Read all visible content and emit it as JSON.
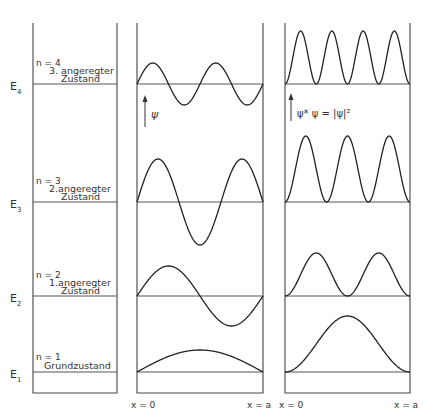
{
  "figure": {
    "panels": {
      "levels": {
        "name": "energy-levels"
      },
      "psi": {
        "name": "wave-function",
        "axis_label": "ψ"
      },
      "density": {
        "name": "probability-density",
        "axis_label": "ψ* ψ = |ψ|²"
      }
    },
    "x_labels": {
      "start": "x = 0",
      "end": "x = a"
    },
    "levels": [
      {
        "n_label": "n = 4",
        "state": "3. angeregter",
        "state2": "Zustand",
        "energy": "E",
        "sub": "4",
        "n": 4
      },
      {
        "n_label": "n = 3",
        "state": "2.angeregter",
        "state2": "Zustand",
        "energy": "E",
        "sub": "3",
        "n": 3
      },
      {
        "n_label": "n = 2",
        "state": "1.angeregter",
        "state2": "Zustand",
        "energy": "E",
        "sub": "2",
        "n": 2
      },
      {
        "n_label": "n = 1",
        "state": "Grundzustand",
        "state2": "",
        "energy": "E",
        "sub": "1",
        "n": 1
      }
    ]
  },
  "chart_data": {
    "type": "line",
    "xlabel": "x (0 to a)",
    "x_ticks": [
      "x = 0",
      "x = a"
    ],
    "series": [
      {
        "name": "ψ (n=4)",
        "function": "sin(4πx/a)",
        "level": "E4"
      },
      {
        "name": "ψ (n=3)",
        "function": "sin(3πx/a)",
        "level": "E3"
      },
      {
        "name": "ψ (n=2)",
        "function": "sin(2πx/a)",
        "level": "E2"
      },
      {
        "name": "ψ (n=1)",
        "function": "sin(πx/a)",
        "level": "E1"
      },
      {
        "name": "|ψ|² (n=4)",
        "function": "sin²(4πx/a)",
        "level": "E4"
      },
      {
        "name": "|ψ|² (n=3)",
        "function": "sin²(3πx/a)",
        "level": "E3"
      },
      {
        "name": "|ψ|² (n=2)",
        "function": "sin²(2πx/a)",
        "level": "E2"
      },
      {
        "name": "|ψ|² (n=1)",
        "function": "sin²(πx/a)",
        "level": "E1"
      }
    ],
    "levels": [
      "E1",
      "E2",
      "E3",
      "E4"
    ],
    "grid": false,
    "legend": "none"
  }
}
